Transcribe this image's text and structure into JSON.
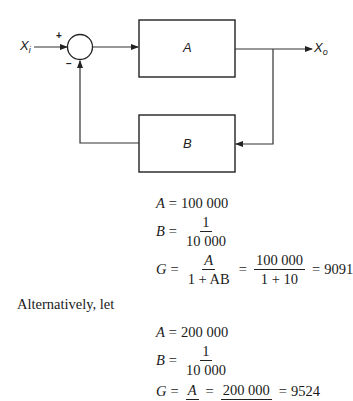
{
  "diagram": {
    "input_label": "X",
    "input_sub": "i",
    "output_label": "X",
    "output_sub": "o",
    "plus_sign": "+",
    "minus_sign": "−",
    "block_forward": "A",
    "block_feedback": "B"
  },
  "case1": {
    "A_lhs": "A",
    "A_value": "100 000",
    "B_lhs": "B",
    "B_num": "1",
    "B_den": "10 000",
    "G_lhs": "G",
    "G_frac1_num": "A",
    "G_frac1_den": "1 + AB",
    "G_frac2_num": "100 000",
    "G_frac2_den": "1 + 10",
    "G_result": "9091"
  },
  "paragraph": "Alternatively, let",
  "case2": {
    "A_lhs": "A",
    "A_value": "200 000",
    "B_lhs": "B",
    "B_num": "1",
    "B_den": "10 000",
    "G_lhs": "G",
    "G_frac1_num": "A",
    "G_frac2_num": "200 000",
    "G_result": "9524"
  },
  "equals": "="
}
